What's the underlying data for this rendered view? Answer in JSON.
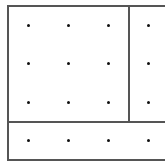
{
  "diagram": {
    "type": "dot-grid-partition",
    "line_color": "#555555",
    "dot_color": "#111111",
    "outer_box": {
      "left": 7,
      "top": 5,
      "bottom": 159,
      "right_open": true
    },
    "vertical_divider_x": 128,
    "horizontal_divider_y": 121,
    "dot_columns_x": [
      28,
      68,
      108,
      148
    ],
    "dot_rows_y": [
      25,
      63,
      102,
      140
    ],
    "regions": [
      {
        "name": "top-left-square",
        "dots": "3x3"
      },
      {
        "name": "top-right-strip",
        "dots": "1x3"
      },
      {
        "name": "bottom-strip",
        "dots": "4x1"
      }
    ]
  }
}
